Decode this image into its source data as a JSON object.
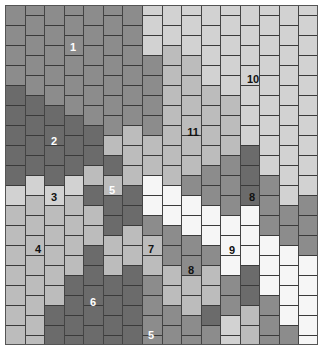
{
  "map": {
    "grid": {
      "left": 5,
      "top": 5,
      "width": 313,
      "height": 340,
      "columns": 16,
      "cell_height": 20
    },
    "palette": {
      "D": "#6b6b6b",
      "M": "#8c8c8c",
      "G": "#a3a3a3",
      "L": "#bcbcbc",
      "VL": "#d2d2d2",
      "W": "#f6f6f6"
    },
    "columns": [
      {
        "offset": 0,
        "cells": [
          "M",
          "M",
          "M",
          "M",
          "D",
          "D",
          "D",
          "D",
          "D",
          "VL",
          "L",
          "L",
          "L",
          "L",
          "L",
          "L",
          "L"
        ]
      },
      {
        "offset": -10,
        "cells": [
          "M",
          "M",
          "M",
          "M",
          "M",
          "D",
          "D",
          "D",
          "D",
          "VL",
          "L",
          "L",
          "L",
          "L",
          "L",
          "L",
          "L",
          "L"
        ]
      },
      {
        "offset": 0,
        "cells": [
          "M",
          "M",
          "M",
          "M",
          "M",
          "D",
          "D",
          "D",
          "D",
          "VL",
          "L",
          "L",
          "L",
          "L",
          "L",
          "D",
          "D"
        ]
      },
      {
        "offset": -10,
        "cells": [
          "M",
          "M",
          "M",
          "M",
          "M",
          "M",
          "D",
          "D",
          "D",
          "VL",
          "L",
          "L",
          "L",
          "L",
          "D",
          "D",
          "D",
          "D"
        ]
      },
      {
        "offset": 0,
        "cells": [
          "M",
          "M",
          "M",
          "M",
          "M",
          "M",
          "D",
          "D",
          "L",
          "D",
          "L",
          "L",
          "D",
          "D",
          "D",
          "D",
          "D"
        ]
      },
      {
        "offset": -10,
        "cells": [
          "M",
          "M",
          "M",
          "M",
          "M",
          "M",
          "M",
          "L",
          "D",
          "L",
          "D",
          "D",
          "L",
          "L",
          "D",
          "D",
          "D",
          "D"
        ]
      },
      {
        "offset": 0,
        "cells": [
          "M",
          "M",
          "M",
          "M",
          "M",
          "M",
          "L",
          "L",
          "L",
          "D",
          "D",
          "L",
          "L",
          "D",
          "D",
          "D",
          "D"
        ]
      },
      {
        "offset": -10,
        "cells": [
          "VL",
          "VL",
          "VL",
          "M",
          "M",
          "M",
          "M",
          "L",
          "L",
          "W",
          "W",
          "M",
          "L",
          "L",
          "M",
          "M",
          "M",
          "M"
        ]
      },
      {
        "offset": 0,
        "cells": [
          "VL",
          "VL",
          "L",
          "L",
          "L",
          "L",
          "L",
          "L",
          "L",
          "W",
          "W",
          "M",
          "M",
          "L",
          "L",
          "M",
          "M"
        ]
      },
      {
        "offset": -10,
        "cells": [
          "VL",
          "VL",
          "VL",
          "L",
          "L",
          "L",
          "L",
          "L",
          "L",
          "M",
          "W",
          "W",
          "M",
          "M",
          "L",
          "L",
          "M",
          "M"
        ]
      },
      {
        "offset": 0,
        "cells": [
          "VL",
          "VL",
          "VL",
          "VL",
          "L",
          "L",
          "L",
          "L",
          "M",
          "M",
          "W",
          "W",
          "M",
          "L",
          "L",
          "D",
          "M"
        ]
      },
      {
        "offset": -10,
        "cells": [
          "VL",
          "VL",
          "VL",
          "VL",
          "VL",
          "L",
          "L",
          "L",
          "M",
          "M",
          "M",
          "W",
          "W",
          "W",
          "M",
          "M",
          "VL",
          "VL"
        ]
      },
      {
        "offset": 0,
        "cells": [
          "VL",
          "VL",
          "VL",
          "VL",
          "VL",
          "VL",
          "VL",
          "D",
          "D",
          "D",
          "W",
          "W",
          "W",
          "D",
          "D",
          "L",
          "L"
        ]
      },
      {
        "offset": -10,
        "cells": [
          "VL",
          "VL",
          "VL",
          "VL",
          "VL",
          "VL",
          "VL",
          "VL",
          "VL",
          "M",
          "M",
          "M",
          "W",
          "W",
          "W",
          "M",
          "M",
          "M"
        ]
      },
      {
        "offset": 0,
        "cells": [
          "VL",
          "VL",
          "VL",
          "VL",
          "VL",
          "VL",
          "VL",
          "VL",
          "VL",
          "VL",
          "M",
          "M",
          "W",
          "W",
          "W",
          "W",
          "M"
        ]
      },
      {
        "offset": -10,
        "cells": [
          "VL",
          "VL",
          "VL",
          "VL",
          "VL",
          "VL",
          "VL",
          "VL",
          "VL",
          "VL",
          "M",
          "M",
          "M",
          "W",
          "W",
          "W",
          "W",
          "W"
        ]
      }
    ],
    "labels": [
      {
        "text": "1",
        "x": 73,
        "y": 47,
        "tone": "light"
      },
      {
        "text": "2",
        "x": 54,
        "y": 141,
        "tone": "light"
      },
      {
        "text": "3",
        "x": 54,
        "y": 197,
        "tone": "dark"
      },
      {
        "text": "4",
        "x": 38,
        "y": 249,
        "tone": "dark"
      },
      {
        "text": "5",
        "x": 112,
        "y": 190,
        "tone": "light"
      },
      {
        "text": "6",
        "x": 93,
        "y": 302,
        "tone": "light"
      },
      {
        "text": "7",
        "x": 151,
        "y": 249,
        "tone": "dark"
      },
      {
        "text": "5",
        "x": 151,
        "y": 335,
        "tone": "light"
      },
      {
        "text": "8",
        "x": 252,
        "y": 197,
        "tone": "dark"
      },
      {
        "text": "8",
        "x": 191,
        "y": 270,
        "tone": "dark"
      },
      {
        "text": "9",
        "x": 232,
        "y": 250,
        "tone": "dark"
      },
      {
        "text": "10",
        "x": 253,
        "y": 79,
        "tone": "dark"
      },
      {
        "text": "11",
        "x": 193,
        "y": 132,
        "tone": "dark"
      }
    ]
  }
}
